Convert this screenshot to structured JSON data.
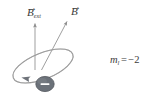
{
  "figure": {
    "background_color": "#ffffff"
  },
  "labels": {
    "b_ext": {
      "base": "B",
      "subscript": "ext",
      "arrow_glyph": "→",
      "semantic": "external magnetic field vector"
    },
    "b_total": {
      "base": "B",
      "subscript": "",
      "arrow_glyph": "→",
      "semantic": "magnetic field vector"
    },
    "quantum_number": {
      "variable": "m",
      "subscript": "l",
      "equals": "=",
      "value": "−2",
      "full_text": "m_l = −2"
    }
  },
  "colors": {
    "orbit_stroke": "#8c8c8c",
    "arrow_stroke": "#9a9a9a",
    "electron_fill": "#6b7179",
    "electron_stroke": "#55595f",
    "electron_sign": "#ffffff",
    "text": "#3c3c3c"
  },
  "geometry": {
    "orbit": {
      "center_x": 43,
      "center_y": 66,
      "radius_x": 32,
      "radius_y": 13,
      "rotation_deg": -22,
      "direction": "counterclockwise"
    },
    "arrow_b_ext": {
      "x1": 35,
      "y1": 70,
      "x2": 35,
      "y2": 21,
      "orientation": "vertical"
    },
    "arrow_b_total": {
      "x1": 42,
      "y1": 70,
      "x2": 68,
      "y2": 20,
      "orientation": "tilted-right"
    },
    "electron": {
      "cx": 45,
      "cy": 84,
      "rx": 9,
      "ry": 7.5,
      "charge": "−"
    },
    "orbit_direction_arrowhead": {
      "x": 24,
      "y": 79,
      "points": "left"
    }
  },
  "icon_names": {
    "electron": "electron-particle-icon",
    "orbit": "orbit-ellipse-icon",
    "field_arrow": "field-vector-arrow-icon",
    "circulation_arrow": "orbit-direction-arrowhead-icon"
  }
}
